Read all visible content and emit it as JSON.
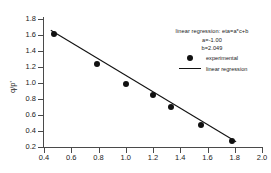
{
  "chart_data": {
    "type": "scatter",
    "title": "",
    "xlabel": "",
    "ylabel": "q/p'",
    "xlim": [
      0.4,
      2.0
    ],
    "ylim": [
      0.2,
      1.8
    ],
    "xticks": [
      0.4,
      0.6,
      0.8,
      1.0,
      1.2,
      1.4,
      1.6,
      1.8,
      2.0
    ],
    "xticklabels": [
      "0.4",
      "0.6",
      "0.8",
      "1.0",
      "1.2",
      "1.4",
      "1.6",
      "1.8",
      "2.0"
    ],
    "yticks": [
      0.2,
      0.4,
      0.6,
      0.8,
      1.0,
      1.2,
      1.4,
      1.6,
      1.8
    ],
    "yticklabels": [
      "0.2",
      "0.4",
      "0.6",
      "0.8",
      "1.0",
      "1.2",
      "1.4",
      "1.6",
      "1.8"
    ],
    "grid": false,
    "legend_position": "upper right",
    "series": [
      {
        "name": "experimental",
        "marker": "filled-circle",
        "color": "#111111",
        "x": [
          0.475,
          0.79,
          1.0,
          1.2,
          1.33,
          1.55,
          1.78
        ],
        "y": [
          1.61,
          1.235,
          0.985,
          0.845,
          0.705,
          0.47,
          0.28
        ]
      },
      {
        "name": "linear regression",
        "marker": "line",
        "color": "#111111",
        "x": [
          0.45,
          1.81
        ],
        "y": [
          1.66,
          0.265
        ]
      }
    ],
    "annotation": {
      "equation": "linear regression: eta=a*c+b",
      "slope_label": "a=-1.00",
      "intercept_label": "b=2.049",
      "slope": -1.0,
      "intercept": 2.049
    }
  },
  "legend": {
    "items": [
      {
        "label": "experimental",
        "key": "filled-circle"
      },
      {
        "label": "linear regression",
        "key": "line"
      }
    ]
  },
  "colors": {
    "axis": "#4a4a4a",
    "data": "#111111",
    "background": "#ffffff",
    "text": "#1a1a1a"
  }
}
